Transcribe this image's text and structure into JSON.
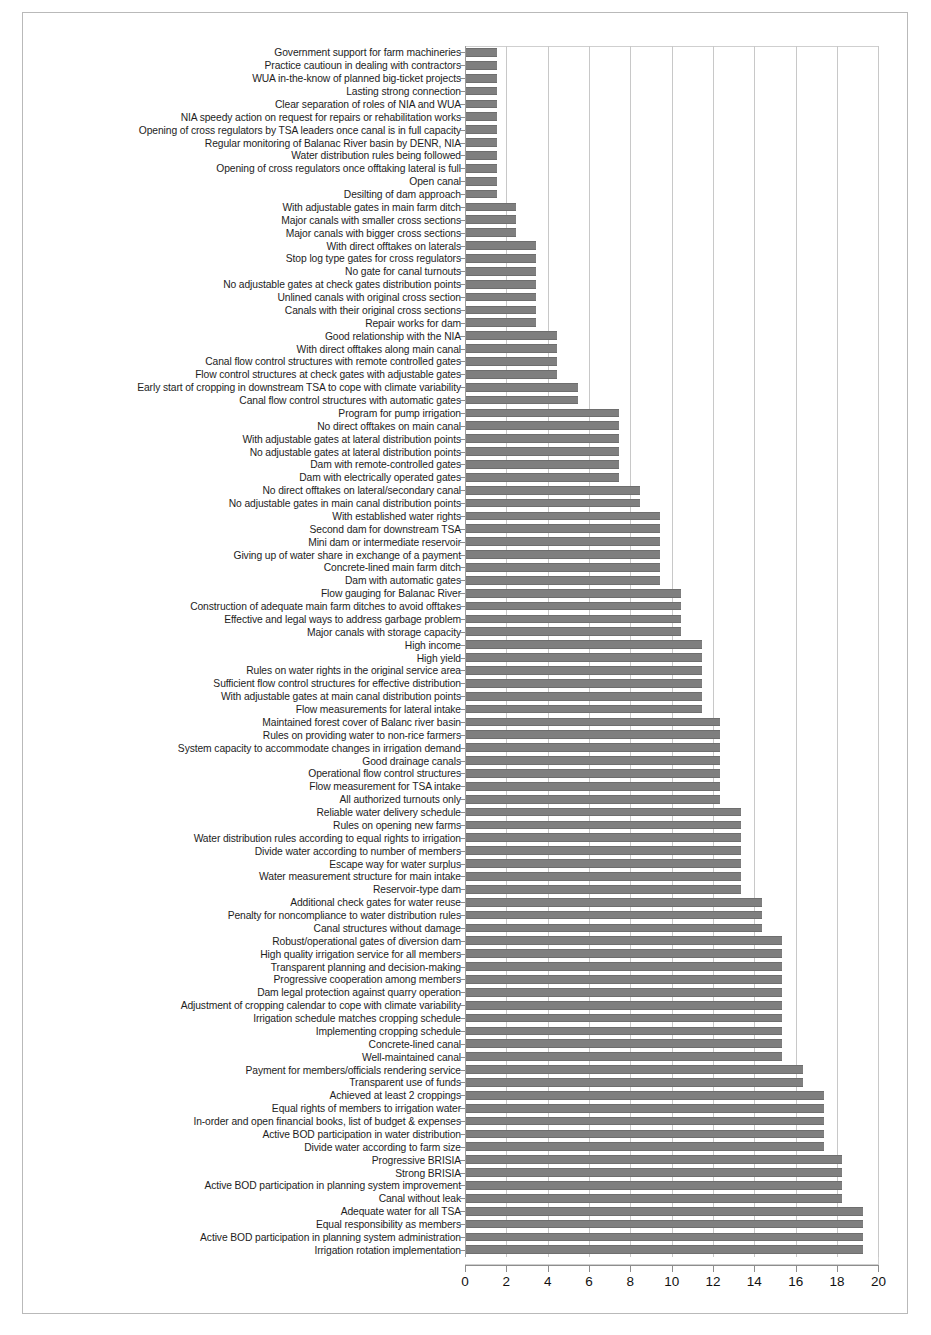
{
  "figure": {
    "orientation": "horizontal",
    "bar_color": "#7f7f7f",
    "grid_color": "#c8c8c8",
    "frame_color": "#b9b9b9"
  },
  "axis": {
    "ticks": [
      0,
      2,
      4,
      6,
      8,
      10,
      12,
      14,
      16,
      18,
      20
    ],
    "tick_labels": [
      "0",
      "2",
      "4",
      "6",
      "8",
      "10",
      "12",
      "14",
      "16",
      "18",
      "20"
    ],
    "min": 0,
    "max": 20
  },
  "chart_data": {
    "type": "bar",
    "title": "",
    "subtitle": "",
    "xlabel": "",
    "ylabel": "",
    "xlim": [
      0,
      20
    ],
    "grid": true,
    "legend": "none",
    "orientation": "horizontal",
    "categories": [
      "Government support for farm machineries",
      "Practice cautioun in dealing with contractors",
      "WUA in-the-know of planned big-ticket projects",
      "Lasting strong connection",
      "Clear separation of roles of NIA and WUA",
      "NIA speedy action on request for repairs or rehabilitation works",
      "Opening of cross regulators by TSA leaders once canal is in full capacity",
      "Regular monitoring of Balanac River basin by DENR, NIA",
      "Water distribution rules being followed",
      "Opening of cross regulators once offtaking lateral is full",
      "Open canal",
      "Desilting of dam approach",
      "With adjustable gates in main farm ditch",
      "Major canals with smaller cross sections",
      "Major canals with bigger cross sections",
      "With direct offtakes on laterals",
      "Stop log type gates for cross regulators",
      "No gate for canal turnouts",
      "No adjustable gates at check gates distribution points",
      "Unlined canals with original cross section",
      "Canals with their original cross sections",
      "Repair works for dam",
      "Good relationship with the NIA",
      "With direct offtakes along main canal",
      "Canal flow control structures with remote controlled gates",
      "Flow control structures at check gates with  adjustable gates",
      "Early start of cropping in downstream TSA to cope with climate variability",
      "Canal flow control structures with automatic gates",
      "Program for pump irrigation",
      "No direct offtakes on main canal",
      "With adjustable gates at lateral distribution points",
      "No adjustable gates at lateral distribution points",
      "Dam with remote-controlled gates",
      "Dam with electrically operated gates",
      "No direct offtakes on lateral/secondary canal",
      "No adjustable gates in main canal distribution points",
      "With established water rights",
      "Second dam for downstream TSA",
      "Mini dam or intermediate reservoir",
      "Giving up of water share in exchange of a payment",
      "Concrete-lined main farm ditch",
      "Dam with automatic gates",
      "Flow gauging for Balanac River",
      "Construction of adequate main farm ditches to avoid offtakes",
      "Effective and legal ways to address garbage problem",
      "Major canals with storage capacity",
      "High income",
      "High yield",
      "Rules on water rights in the original service area",
      "Sufficient flow control structures for effective distribution",
      "With adjustable gates at main canal distribution points",
      "Flow measurements for lateral intake",
      "Maintained forest cover of Balanc river basin",
      "Rules on providing water to non-rice farmers",
      "System capacity to accommodate  changes in irrigation demand",
      "Good drainage canals",
      "Operational flow control structures",
      "Flow measurement for TSA intake",
      "All authorized turnouts only",
      "Reliable water delivery schedule",
      "Rules on opening new farms",
      "Water distribution rules according to equal rights to irrigation",
      "Divide water according to number of members",
      "Escape way for water surplus",
      "Water measurement structure for main intake",
      "Reservoir-type dam",
      "Additional check gates for water reuse",
      "Penalty for noncompliance to water distribution rules",
      "Canal structures without damage",
      "Robust/operational gates of diversion dam",
      "High quality irrigation service for all members",
      "Transparent planning and decision-making",
      "Progressive cooperation among members",
      "Dam legal protection against quarry operation",
      "Adjustment of cropping calendar to cope with climate variability",
      "Irrigation schedule matches cropping schedule",
      "Implementing cropping schedule",
      "Concrete-lined canal",
      "Well-maintained canal",
      "Payment for members/officials rendering service",
      "Transparent use of funds",
      "Achieved at least 2 croppings",
      "Equal rights of members to irrigation water",
      "In-order and open financial books, list of budget & expenses",
      "Active BOD participation in water distribution",
      "Divide water according to farm size",
      "Progressive BRISIA",
      "Strong BRISIA",
      "Active BOD participation in planning system improvement",
      "Canal without leak",
      "Adequate water for all TSA",
      "Equal responsibility as members",
      "Active BOD participation in planning system administration",
      "Irrigation rotation implementation"
    ],
    "values": [
      1.5,
      1.5,
      1.5,
      1.5,
      1.5,
      1.5,
      1.5,
      1.5,
      1.5,
      1.5,
      1.5,
      1.5,
      2.4,
      2.4,
      2.4,
      3.4,
      3.4,
      3.4,
      3.4,
      3.4,
      3.4,
      3.4,
      4.4,
      4.4,
      4.4,
      4.4,
      5.4,
      5.4,
      7.4,
      7.4,
      7.4,
      7.4,
      7.4,
      7.4,
      8.4,
      8.4,
      9.4,
      9.4,
      9.4,
      9.4,
      9.4,
      9.4,
      10.4,
      10.4,
      10.4,
      10.4,
      11.4,
      11.4,
      11.4,
      11.4,
      11.4,
      11.4,
      12.3,
      12.3,
      12.3,
      12.3,
      12.3,
      12.3,
      12.3,
      13.3,
      13.3,
      13.3,
      13.3,
      13.3,
      13.3,
      13.3,
      14.3,
      14.3,
      14.3,
      15.3,
      15.3,
      15.3,
      15.3,
      15.3,
      15.3,
      15.3,
      15.3,
      15.3,
      15.3,
      16.3,
      16.3,
      17.3,
      17.3,
      17.3,
      17.3,
      17.3,
      18.2,
      18.2,
      18.2,
      18.2,
      19.2,
      19.2,
      19.2,
      19.2
    ]
  }
}
